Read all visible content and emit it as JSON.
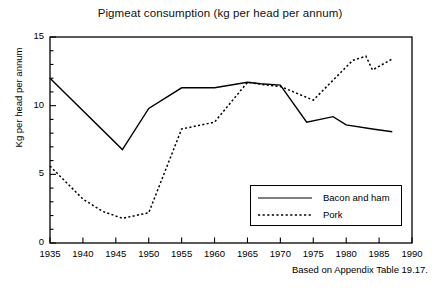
{
  "chart_data": {
    "type": "line",
    "title": "Pigmeat consumption (kg per head per annum)",
    "xlabel": "",
    "ylabel": "Kg per head per annum",
    "xlim": [
      1935,
      1990
    ],
    "ylim": [
      0,
      15
    ],
    "xticks": [
      1935,
      1940,
      1945,
      1950,
      1955,
      1960,
      1965,
      1970,
      1975,
      1980,
      1985,
      1990
    ],
    "yticks": [
      0,
      5,
      10,
      15
    ],
    "yminor_step": 1,
    "grid": false,
    "legend_position": "lower right",
    "series": [
      {
        "name": "Bacon and ham",
        "style": "solid",
        "color": "#000000",
        "points": [
          [
            1935,
            12.0
          ],
          [
            1946,
            6.8
          ],
          [
            1950,
            9.8
          ],
          [
            1955,
            11.3
          ],
          [
            1960,
            11.3
          ],
          [
            1965,
            11.7
          ],
          [
            1967,
            11.6
          ],
          [
            1970,
            11.5
          ],
          [
            1974,
            8.8
          ],
          [
            1978,
            9.2
          ],
          [
            1980,
            8.6
          ],
          [
            1984,
            8.3
          ],
          [
            1987,
            8.1
          ]
        ]
      },
      {
        "name": "Pork",
        "style": "dotted",
        "color": "#000000",
        "points": [
          [
            1935,
            5.6
          ],
          [
            1940,
            3.2
          ],
          [
            1943,
            2.3
          ],
          [
            1946,
            1.8
          ],
          [
            1950,
            2.2
          ],
          [
            1955,
            8.3
          ],
          [
            1960,
            8.8
          ],
          [
            1965,
            11.7
          ],
          [
            1968,
            11.5
          ],
          [
            1970,
            11.4
          ],
          [
            1975,
            10.4
          ],
          [
            1981,
            13.3
          ],
          [
            1983,
            13.6
          ],
          [
            1984,
            12.6
          ],
          [
            1987,
            13.4
          ]
        ]
      }
    ],
    "annotations": {
      "source_note": "Based on Appendix Table 19.17."
    }
  },
  "chart": {
    "title": "Pigmeat consumption (kg per head per annum)",
    "ylabel": "Kg per head per annum",
    "source_note": "Based on Appendix Table 19.17.",
    "yticks": [
      "0",
      "5",
      "10",
      "15"
    ],
    "xticks": [
      "1935",
      "1940",
      "1945",
      "1950",
      "1955",
      "1960",
      "1965",
      "1970",
      "1975",
      "1980",
      "1985",
      "1990"
    ],
    "legend": {
      "items": [
        {
          "label": "Bacon and ham"
        },
        {
          "label": "Pork"
        }
      ]
    }
  }
}
